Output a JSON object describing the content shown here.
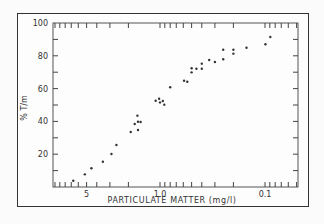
{
  "chart_data": {
    "type": "scatter",
    "title": "",
    "xlabel": "PARTICULATE MATTER (mg/l)",
    "ylabel": "% T/m",
    "x_scale": "log-reversed",
    "xlim": [
      10,
      0.05
    ],
    "ylim": [
      0,
      100
    ],
    "x_tick_labels": [
      "5",
      "1.0",
      "0.1"
    ],
    "x_tick_values": [
      5,
      1.0,
      0.1
    ],
    "y_tick_labels": [
      "20",
      "40",
      "60",
      "80",
      "100"
    ],
    "y_tick_values": [
      20,
      40,
      60,
      80,
      100
    ],
    "grid": false,
    "legend": null,
    "series": [
      {
        "name": "observations",
        "points": [
          {
            "x": 6.7,
            "y": 3.8
          },
          {
            "x": 5.2,
            "y": 7.7
          },
          {
            "x": 4.5,
            "y": 11.4
          },
          {
            "x": 3.5,
            "y": 15.4
          },
          {
            "x": 2.9,
            "y": 20.1
          },
          {
            "x": 2.6,
            "y": 25.6
          },
          {
            "x": 1.9,
            "y": 33.5
          },
          {
            "x": 1.74,
            "y": 38.4
          },
          {
            "x": 1.64,
            "y": 43.5
          },
          {
            "x": 1.62,
            "y": 39.8
          },
          {
            "x": 1.53,
            "y": 39.6
          },
          {
            "x": 1.62,
            "y": 34.8
          },
          {
            "x": 1.1,
            "y": 52.6
          },
          {
            "x": 1.02,
            "y": 53.8
          },
          {
            "x": 0.94,
            "y": 52.4
          },
          {
            "x": 1.0,
            "y": 51.6
          },
          {
            "x": 0.91,
            "y": 50.2
          },
          {
            "x": 0.8,
            "y": 60.8
          },
          {
            "x": 0.59,
            "y": 64.8
          },
          {
            "x": 0.55,
            "y": 64.2
          },
          {
            "x": 0.5,
            "y": 72.4
          },
          {
            "x": 0.5,
            "y": 69.9
          },
          {
            "x": 0.45,
            "y": 72.1
          },
          {
            "x": 0.4,
            "y": 72.1
          },
          {
            "x": 0.4,
            "y": 75.2
          },
          {
            "x": 0.34,
            "y": 77.4
          },
          {
            "x": 0.3,
            "y": 76.2
          },
          {
            "x": 0.25,
            "y": 83.7
          },
          {
            "x": 0.2,
            "y": 83.7
          },
          {
            "x": 0.2,
            "y": 81.3
          },
          {
            "x": 0.25,
            "y": 77.9
          },
          {
            "x": 0.15,
            "y": 84.9
          },
          {
            "x": 0.099,
            "y": 87.0
          },
          {
            "x": 0.089,
            "y": 91.5
          }
        ]
      }
    ]
  },
  "colors": {
    "frame": "#333333",
    "points": "#333333",
    "background": "#fdfdfd"
  }
}
